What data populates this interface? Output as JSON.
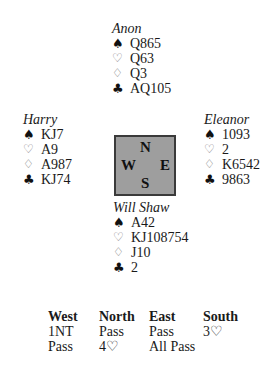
{
  "deal": {
    "north": {
      "name": "Anon",
      "spades": "Q865",
      "hearts": "Q63",
      "diamonds": "Q3",
      "clubs": "AQ105"
    },
    "west": {
      "name": "Harry",
      "spades": "KJ7",
      "hearts": "A9",
      "diamonds": "A987",
      "clubs": "KJ74"
    },
    "east": {
      "name": "Eleanor",
      "spades": "1093",
      "hearts": "2",
      "diamonds": "K6542",
      "clubs": "9863"
    },
    "south": {
      "name": "Will Shaw",
      "spades": "A42",
      "hearts": "KJ108754",
      "diamonds": "J10",
      "clubs": "2"
    }
  },
  "icons": {
    "spade": "♠",
    "heart": "♡",
    "diamond": "♢",
    "club": "♣"
  },
  "compass": {
    "n": "N",
    "s": "S",
    "e": "E",
    "w": "W",
    "background": "#9e9e9e",
    "border": "#3a3a3a"
  },
  "auction": {
    "headers": [
      "West",
      "North",
      "East",
      "South"
    ],
    "rows": [
      [
        "1NT",
        "Pass",
        "Pass",
        "3♡"
      ],
      [
        "Pass",
        "4♡",
        "All Pass",
        ""
      ]
    ]
  }
}
